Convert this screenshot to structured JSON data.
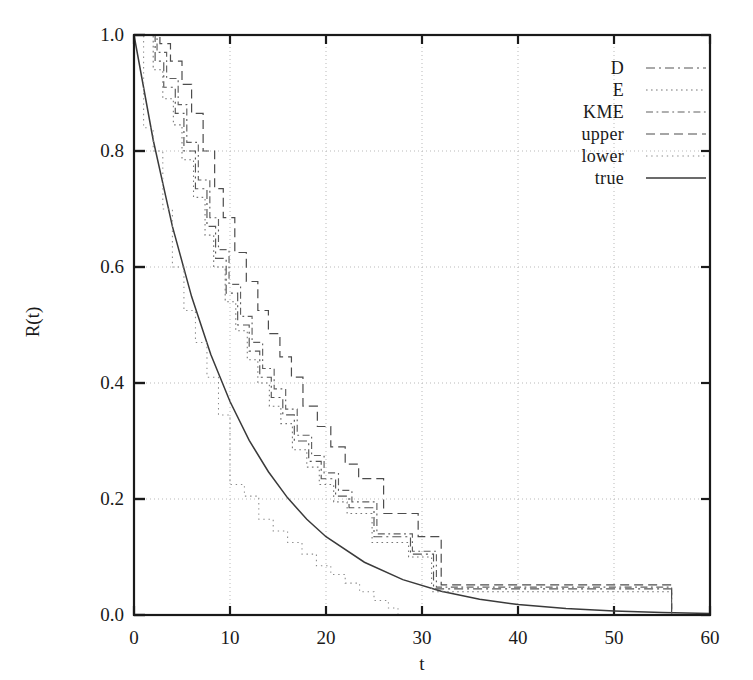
{
  "chart_data": {
    "type": "line",
    "title": "",
    "xlabel": "t",
    "ylabel": "R(t)",
    "xlim": [
      0,
      60
    ],
    "ylim": [
      0,
      1.0
    ],
    "xticks": [
      0,
      10,
      20,
      30,
      40,
      50,
      60
    ],
    "yticks": [
      "0.0",
      "0.2",
      "0.4",
      "0.6",
      "0.8",
      "1.0"
    ],
    "ytick_values": [
      0.0,
      0.2,
      0.4,
      0.6,
      0.8,
      1.0
    ],
    "grid": "dotted-both-axes",
    "legend_position": "top-right-inside",
    "legend": [
      "D",
      "E",
      "KME",
      "upper",
      "lower",
      "true"
    ],
    "series": [
      {
        "name": "true",
        "style": "solid",
        "kind": "smooth-exponential",
        "formula": "R(t) = exp(-t/10)",
        "x": [
          0,
          2,
          4,
          6,
          8,
          10,
          12,
          14,
          16,
          18,
          20,
          24,
          28,
          32,
          36,
          40,
          45,
          50,
          55,
          60
        ],
        "y": [
          1.0,
          0.819,
          0.67,
          0.549,
          0.449,
          0.368,
          0.301,
          0.247,
          0.202,
          0.165,
          0.135,
          0.091,
          0.061,
          0.041,
          0.027,
          0.018,
          0.011,
          0.0067,
          0.0041,
          0.0025
        ]
      },
      {
        "name": "D",
        "style": "dash-dot",
        "kind": "step",
        "x": [
          0,
          2.2,
          3.1,
          4.3,
          5.2,
          6.4,
          7.6,
          8.5,
          9.6,
          10.8,
          12.0,
          13.1,
          14.3,
          15.5,
          16.7,
          18.2,
          19.5,
          21.0,
          22.4,
          25.0,
          28.8,
          31.2,
          56.0
        ],
        "y": [
          1.0,
          0.955,
          0.91,
          0.865,
          0.8,
          0.735,
          0.67,
          0.615,
          0.555,
          0.5,
          0.455,
          0.41,
          0.375,
          0.345,
          0.3,
          0.265,
          0.235,
          0.205,
          0.185,
          0.135,
          0.105,
          0.045,
          0.0
        ]
      },
      {
        "name": "E",
        "style": "dotted",
        "kind": "step",
        "x": [
          0,
          2.0,
          3.0,
          4.1,
          5.0,
          6.2,
          7.4,
          8.3,
          9.5,
          10.6,
          11.8,
          12.9,
          14.1,
          15.3,
          16.5,
          18.0,
          19.3,
          20.8,
          22.2,
          24.8,
          28.6,
          31.0,
          56.0
        ],
        "y": [
          1.0,
          0.94,
          0.89,
          0.845,
          0.785,
          0.72,
          0.655,
          0.6,
          0.54,
          0.49,
          0.44,
          0.4,
          0.36,
          0.33,
          0.285,
          0.255,
          0.225,
          0.195,
          0.175,
          0.125,
          0.1,
          0.04,
          0.0
        ]
      },
      {
        "name": "KME",
        "style": "dash-dot-long",
        "kind": "step",
        "x": [
          0,
          2.4,
          3.4,
          4.6,
          5.5,
          6.7,
          7.9,
          8.8,
          9.9,
          11.1,
          12.3,
          13.4,
          14.6,
          15.8,
          17.0,
          18.5,
          19.8,
          21.3,
          22.7,
          25.3,
          29.0,
          31.5,
          56.0
        ],
        "y": [
          1.0,
          0.97,
          0.925,
          0.88,
          0.815,
          0.75,
          0.685,
          0.63,
          0.57,
          0.515,
          0.47,
          0.425,
          0.39,
          0.355,
          0.31,
          0.275,
          0.245,
          0.215,
          0.195,
          0.14,
          0.11,
          0.048,
          0.0
        ]
      },
      {
        "name": "upper",
        "style": "dashed",
        "kind": "step",
        "x": [
          0,
          2.7,
          3.8,
          5.0,
          6.0,
          7.2,
          8.4,
          9.3,
          10.5,
          11.7,
          12.9,
          14.0,
          15.2,
          16.4,
          17.6,
          19.1,
          20.5,
          22.0,
          23.4,
          26.0,
          29.6,
          32.0,
          56.0
        ],
        "y": [
          1.0,
          0.985,
          0.955,
          0.915,
          0.865,
          0.8,
          0.735,
          0.685,
          0.625,
          0.575,
          0.525,
          0.485,
          0.445,
          0.41,
          0.36,
          0.325,
          0.29,
          0.26,
          0.235,
          0.175,
          0.135,
          0.052,
          0.0
        ]
      },
      {
        "name": "lower",
        "style": "fine-dotted",
        "kind": "step",
        "x": [
          0,
          1.0,
          2.0,
          3.0,
          4.0,
          5.2,
          6.4,
          7.6,
          8.8,
          10.0,
          11.5,
          13.0,
          14.5,
          16.0,
          17.5,
          19.0,
          20.5,
          22.0,
          23.5,
          25.0,
          26.5,
          27.5
        ],
        "y": [
          1.0,
          0.84,
          0.8,
          0.7,
          0.6,
          0.525,
          0.47,
          0.41,
          0.345,
          0.225,
          0.205,
          0.165,
          0.145,
          0.125,
          0.105,
          0.085,
          0.07,
          0.055,
          0.04,
          0.025,
          0.012,
          0.0
        ]
      }
    ],
    "colors": {
      "axis": "#1a1a1a",
      "grid": "#b9b9b9",
      "true": "#3a3a3a",
      "D": "#555555",
      "E": "#777777",
      "KME": "#606060",
      "upper": "#4d4d4d",
      "lower": "#8a8a8a"
    }
  }
}
